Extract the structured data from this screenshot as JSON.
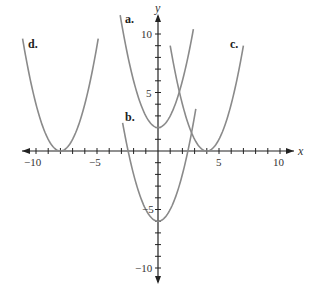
{
  "chart_data": {
    "type": "line",
    "title": "",
    "xlabel": "x",
    "ylabel": "y",
    "xlim": [
      -11,
      11
    ],
    "ylim": [
      -11,
      11
    ],
    "grid": false,
    "x_tick_labels": [
      "-10",
      "-5",
      "5",
      "10"
    ],
    "y_tick_labels": [
      "10",
      "5",
      "-5",
      "-10"
    ],
    "series": [
      {
        "name": "a.",
        "equation": "y = x^2 + 2",
        "vertex": [
          0,
          2
        ],
        "x_range": [
          -3.1,
          2.9
        ]
      },
      {
        "name": "b.",
        "equation": "y = x^2 - 6",
        "vertex": [
          0,
          -6
        ],
        "x_range": [
          -2.9,
          3.1
        ]
      },
      {
        "name": "c.",
        "equation": "y = (x - 4)^2",
        "vertex": [
          4,
          0
        ],
        "x_range": [
          1.0,
          7.0
        ]
      },
      {
        "name": "d.",
        "equation": "y = (x + 8)^2",
        "vertex": [
          -8,
          0
        ],
        "x_range": [
          -11.1,
          -4.9
        ]
      }
    ]
  },
  "labels": {
    "x_axis": "x",
    "y_axis": "y",
    "curve_a": "a.",
    "curve_b": "b.",
    "curve_c": "c.",
    "curve_d": "d.",
    "tick_x_neg10": "−10",
    "tick_x_neg5": "−5",
    "tick_x_5": "5",
    "tick_x_10": "10",
    "tick_y_10": "10",
    "tick_y_5": "5",
    "tick_y_neg5": "−5",
    "tick_y_neg10": "−10"
  },
  "colors": {
    "curve": "#8a8a8a",
    "axis": "#222222"
  }
}
